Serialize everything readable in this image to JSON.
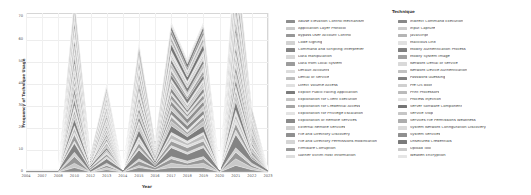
{
  "chart_data": {
    "type": "area",
    "title": "",
    "xlabel": "Year",
    "ylabel": "Frequency of Technique Usage",
    "legend_title": "Technique",
    "legend_position": "right",
    "grid": true,
    "stacked": true,
    "xlim": [
      2004,
      2023
    ],
    "ylim": [
      0,
      72
    ],
    "yticks": [
      0,
      10,
      20,
      30,
      40,
      50,
      60,
      70
    ],
    "categories": [
      2004,
      2007,
      2008,
      2010,
      2012,
      2013,
      2014,
      2015,
      2016,
      2017,
      2018,
      2019,
      2020,
      2021,
      2022,
      2023
    ],
    "totals": [
      1,
      1,
      2,
      62,
      9,
      24,
      3,
      47,
      13,
      50,
      38,
      51,
      4,
      68,
      21,
      2
    ],
    "series": [
      {
        "name": "Abuse Elevation Control Mechanism",
        "color": "#8d8d8d",
        "values": [
          0,
          0,
          0,
          2,
          0,
          1,
          0,
          2,
          1,
          2,
          2,
          2,
          0,
          3,
          1,
          0
        ]
      },
      {
        "name": "Application Layer Protocol",
        "color": "#c9c9c9",
        "values": [
          0,
          0,
          0,
          2,
          0,
          1,
          0,
          1,
          0,
          2,
          1,
          2,
          0,
          3,
          1,
          0
        ]
      },
      {
        "name": "Bypass User Account Control",
        "color": "#979797",
        "values": [
          0,
          0,
          0,
          3,
          0,
          1,
          0,
          2,
          1,
          2,
          1,
          2,
          0,
          3,
          1,
          0
        ]
      },
      {
        "name": "Code Signing",
        "color": "#d2d2d2",
        "values": [
          0,
          0,
          0,
          2,
          0,
          1,
          0,
          1,
          0,
          1,
          1,
          1,
          0,
          2,
          1,
          0
        ]
      },
      {
        "name": "Command and Scripting Interpreter",
        "color": "#848484",
        "values": [
          1,
          1,
          1,
          4,
          1,
          2,
          1,
          4,
          1,
          4,
          3,
          4,
          1,
          6,
          2,
          1
        ]
      },
      {
        "name": "Data Manipulation",
        "color": "#d8d8d8",
        "values": [
          0,
          0,
          0,
          1,
          0,
          1,
          0,
          1,
          0,
          1,
          1,
          1,
          0,
          2,
          0,
          0
        ]
      },
      {
        "name": "Data from Local System",
        "color": "#9c9c9c",
        "values": [
          0,
          0,
          0,
          3,
          1,
          1,
          0,
          2,
          1,
          2,
          2,
          2,
          0,
          3,
          1,
          0
        ]
      },
      {
        "name": "Default Accounts",
        "color": "#dcdcdc",
        "values": [
          0,
          0,
          0,
          1,
          0,
          1,
          0,
          1,
          0,
          1,
          1,
          1,
          0,
          2,
          0,
          0
        ]
      },
      {
        "name": "Denial of Service",
        "color": "#bdbdbd",
        "values": [
          0,
          0,
          0,
          2,
          0,
          1,
          0,
          1,
          0,
          2,
          1,
          2,
          0,
          2,
          1,
          0
        ]
      },
      {
        "name": "Direct Volume Access",
        "color": "#e0e0e0",
        "values": [
          0,
          0,
          0,
          1,
          0,
          0,
          0,
          1,
          0,
          1,
          1,
          1,
          0,
          2,
          0,
          0
        ]
      },
      {
        "name": "Exploit Public-Facing Application",
        "color": "#7c7c7c",
        "values": [
          0,
          0,
          0,
          3,
          1,
          1,
          0,
          3,
          1,
          3,
          2,
          3,
          0,
          4,
          1,
          0
        ]
      },
      {
        "name": "Exploitation for Client Execution",
        "color": "#c4c4c4",
        "values": [
          0,
          0,
          0,
          2,
          0,
          1,
          0,
          2,
          1,
          2,
          1,
          2,
          0,
          3,
          1,
          0
        ]
      },
      {
        "name": "Exploitation for Credential Access",
        "color": "#a6a6a6",
        "values": [
          0,
          0,
          0,
          2,
          0,
          1,
          0,
          1,
          0,
          2,
          1,
          2,
          0,
          2,
          1,
          0
        ]
      },
      {
        "name": "Exploitation for Privilege Escalation",
        "color": "#e3e3e3",
        "values": [
          0,
          0,
          0,
          2,
          0,
          1,
          0,
          1,
          0,
          1,
          1,
          1,
          0,
          2,
          1,
          0
        ]
      },
      {
        "name": "Exploitation of Remote Services",
        "color": "#8a8a8a",
        "values": [
          0,
          0,
          0,
          3,
          0,
          1,
          0,
          2,
          1,
          2,
          2,
          2,
          0,
          3,
          1,
          0
        ]
      },
      {
        "name": "External Remote Services",
        "color": "#cfcfcf",
        "values": [
          0,
          0,
          0,
          2,
          0,
          1,
          0,
          2,
          0,
          2,
          1,
          2,
          0,
          3,
          1,
          0
        ]
      },
      {
        "name": "File and Directory Discovery",
        "color": "#909090",
        "values": [
          0,
          0,
          0,
          3,
          1,
          1,
          0,
          2,
          1,
          2,
          2,
          2,
          0,
          3,
          1,
          0
        ]
      },
      {
        "name": "File and Directory Permissions Modification",
        "color": "#d5d5d5",
        "values": [
          0,
          0,
          0,
          1,
          0,
          1,
          0,
          1,
          0,
          1,
          1,
          1,
          0,
          2,
          0,
          0
        ]
      },
      {
        "name": "Firmware Corruption",
        "color": "#9a9a9a",
        "values": [
          0,
          0,
          0,
          2,
          0,
          1,
          0,
          1,
          0,
          2,
          1,
          2,
          0,
          2,
          1,
          0
        ]
      },
      {
        "name": "Gather Victim Host Information",
        "color": "#dedede",
        "values": [
          0,
          0,
          0,
          1,
          0,
          1,
          0,
          1,
          0,
          1,
          1,
          1,
          0,
          2,
          0,
          0
        ]
      },
      {
        "name": "Indirect Command Execution",
        "color": "#888888",
        "values": [
          0,
          0,
          0,
          2,
          0,
          1,
          0,
          2,
          1,
          2,
          1,
          2,
          0,
          3,
          1,
          0
        ]
      },
      {
        "name": "Input Capture",
        "color": "#cccccc",
        "values": [
          0,
          0,
          0,
          2,
          0,
          1,
          0,
          1,
          0,
          2,
          1,
          2,
          0,
          2,
          1,
          0
        ]
      },
      {
        "name": "JavaScript",
        "color": "#b5b5b5",
        "values": [
          0,
          0,
          0,
          2,
          0,
          1,
          0,
          1,
          0,
          1,
          1,
          1,
          0,
          2,
          1,
          0
        ]
      },
      {
        "name": "Malicious Link",
        "color": "#e1e1e1",
        "values": [
          0,
          0,
          0,
          1,
          0,
          1,
          0,
          1,
          0,
          1,
          1,
          1,
          0,
          2,
          0,
          0
        ]
      },
      {
        "name": "Modify Authentication Process",
        "color": "#7f7f7f",
        "values": [
          0,
          0,
          0,
          3,
          1,
          1,
          0,
          2,
          1,
          2,
          2,
          2,
          0,
          3,
          1,
          0
        ]
      },
      {
        "name": "Modify System Image",
        "color": "#a1a1a1",
        "values": [
          0,
          0,
          0,
          2,
          0,
          1,
          0,
          2,
          0,
          2,
          1,
          2,
          0,
          3,
          1,
          0
        ]
      },
      {
        "name": "Network Denial of Service",
        "color": "#d9d9d9",
        "values": [
          0,
          0,
          0,
          1,
          0,
          1,
          0,
          1,
          0,
          1,
          1,
          1,
          0,
          2,
          0,
          0
        ]
      },
      {
        "name": "Network Device Authentication",
        "color": "#c1c1c1",
        "values": [
          0,
          0,
          0,
          2,
          0,
          1,
          0,
          1,
          0,
          2,
          1,
          2,
          0,
          2,
          1,
          0
        ]
      },
      {
        "name": "Password Guessing",
        "color": "#818181",
        "values": [
          0,
          0,
          0,
          3,
          1,
          1,
          0,
          2,
          1,
          2,
          2,
          2,
          0,
          3,
          1,
          0
        ]
      },
      {
        "name": "Pre-OS Boot",
        "color": "#d0d0d0",
        "values": [
          0,
          0,
          0,
          1,
          0,
          1,
          0,
          1,
          0,
          1,
          1,
          1,
          0,
          2,
          0,
          0
        ]
      },
      {
        "name": "Print Processors",
        "color": "#bbbbbb",
        "values": [
          0,
          0,
          0,
          2,
          0,
          1,
          0,
          1,
          0,
          1,
          1,
          1,
          0,
          2,
          1,
          0
        ]
      },
      {
        "name": "Process Injection",
        "color": "#e2e2e2",
        "values": [
          0,
          0,
          0,
          2,
          0,
          1,
          0,
          1,
          0,
          2,
          1,
          2,
          0,
          2,
          1,
          0
        ]
      },
      {
        "name": "Server Software Component",
        "color": "#757575",
        "values": [
          0,
          0,
          0,
          3,
          1,
          1,
          0,
          2,
          1,
          3,
          2,
          3,
          0,
          4,
          1,
          0
        ]
      },
      {
        "name": "Service Stop",
        "color": "#c6c6c6",
        "values": [
          0,
          0,
          0,
          1,
          0,
          1,
          0,
          1,
          0,
          1,
          1,
          1,
          0,
          2,
          0,
          0
        ]
      },
      {
        "name": "Services File Permissions Weakness",
        "color": "#adadad",
        "values": [
          0,
          0,
          0,
          2,
          0,
          1,
          0,
          1,
          0,
          2,
          1,
          2,
          0,
          2,
          1,
          0
        ]
      },
      {
        "name": "System Network Configuration Discovery",
        "color": "#dadada",
        "values": [
          0,
          0,
          0,
          1,
          0,
          1,
          0,
          1,
          0,
          1,
          1,
          1,
          0,
          2,
          0,
          0
        ]
      },
      {
        "name": "System Services",
        "color": "#8f8f8f",
        "values": [
          0,
          0,
          0,
          2,
          0,
          1,
          0,
          2,
          1,
          2,
          1,
          2,
          0,
          3,
          1,
          0
        ]
      },
      {
        "name": "Unsecured Credentials",
        "color": "#7a7a7a",
        "values": [
          0,
          0,
          0,
          3,
          1,
          1,
          0,
          2,
          1,
          2,
          2,
          2,
          0,
          3,
          1,
          0
        ]
      },
      {
        "name": "Upload Tool",
        "color": "#cbcbcb",
        "values": [
          0,
          0,
          0,
          1,
          0,
          1,
          0,
          1,
          0,
          1,
          1,
          1,
          0,
          2,
          0,
          0
        ]
      },
      {
        "name": "Weaken Encryption",
        "color": "#e5e5e5",
        "values": [
          0,
          0,
          0,
          1,
          0,
          1,
          0,
          1,
          0,
          1,
          1,
          1,
          0,
          2,
          0,
          0
        ]
      }
    ]
  },
  "legend": {
    "title": "Technique",
    "columns": [
      [
        "Abuse Elevation Control Mechanism",
        "Application Layer Protocol",
        "Bypass User Account Control",
        "Code Signing",
        "Command and Scripting Interpreter",
        "Data Manipulation",
        "Data from Local System",
        "Default Accounts",
        "Denial of Service",
        "Direct Volume Access",
        "Exploit Public-Facing Application",
        "Exploitation for Client Execution",
        "Exploitation for Credential Access",
        "Exploitation for Privilege Escalation",
        "Exploitation of Remote Services",
        "External Remote Services",
        "File and Directory Discovery",
        "File and Directory Permissions Modification",
        "Firmware Corruption",
        "Gather Victim Host Information"
      ],
      [
        "Indirect Command Execution",
        "Input Capture",
        "JavaScript",
        "Malicious Link",
        "Modify Authentication Process",
        "Modify System Image",
        "Network Denial of Service",
        "Network Device Authentication",
        "Password Guessing",
        "Pre-OS Boot",
        "Print Processors",
        "Process Injection",
        "Server Software Component",
        "Service Stop",
        "Services File Permissions Weakness",
        "System Network Configuration Discovery",
        "System Services",
        "Unsecured Credentials",
        "Upload Tool",
        "Weaken Encryption"
      ]
    ]
  }
}
